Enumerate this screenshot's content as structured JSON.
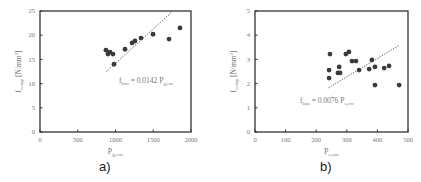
{
  "chart_data": [
    {
      "type": "scatter",
      "panel_label": "a)",
      "xlabel": "P_g,env",
      "ylabel": "f_comp [N/mm²]",
      "xlim": [
        0,
        2000
      ],
      "ylim": [
        0,
        25
      ],
      "xticks": [
        0,
        500,
        1000,
        1500,
        2000
      ],
      "yticks": [
        0,
        5,
        10,
        15,
        20,
        25
      ],
      "grid": false,
      "points": [
        {
          "x": 874,
          "y": 16.9
        },
        {
          "x": 927,
          "y": 16.5
        },
        {
          "x": 900,
          "y": 16.1
        },
        {
          "x": 967,
          "y": 16.1
        },
        {
          "x": 980,
          "y": 14.0
        },
        {
          "x": 1126,
          "y": 17.1
        },
        {
          "x": 1219,
          "y": 18.4
        },
        {
          "x": 1258,
          "y": 18.8
        },
        {
          "x": 1338,
          "y": 19.4
        },
        {
          "x": 1497,
          "y": 20.2
        },
        {
          "x": 1709,
          "y": 19.2
        },
        {
          "x": 1854,
          "y": 21.5
        }
      ],
      "trendline": {
        "slope": 0.0142,
        "x_start": 880,
        "x_end": 1760,
        "style": "dotted"
      },
      "annotation": "f_bias = 0.0142 P_g,env"
    },
    {
      "type": "scatter",
      "panel_label": "b)",
      "xlabel": "P_s,env",
      "ylabel": "f_comp [N/mm²]",
      "xlim": [
        0,
        500
      ],
      "ylim": [
        0,
        5
      ],
      "xticks": [
        0,
        100,
        200,
        300,
        400,
        500
      ],
      "yticks": [
        0,
        1,
        2,
        3,
        4,
        5
      ],
      "grid": false,
      "points": [
        {
          "x": 245,
          "y": 3.22
        },
        {
          "x": 242,
          "y": 2.56
        },
        {
          "x": 242,
          "y": 2.23
        },
        {
          "x": 271,
          "y": 2.44
        },
        {
          "x": 275,
          "y": 2.69
        },
        {
          "x": 278,
          "y": 2.44
        },
        {
          "x": 297,
          "y": 3.22
        },
        {
          "x": 307,
          "y": 3.31
        },
        {
          "x": 317,
          "y": 2.93
        },
        {
          "x": 330,
          "y": 2.93
        },
        {
          "x": 340,
          "y": 2.56
        },
        {
          "x": 373,
          "y": 2.6
        },
        {
          "x": 382,
          "y": 2.98
        },
        {
          "x": 392,
          "y": 2.69
        },
        {
          "x": 392,
          "y": 1.94
        },
        {
          "x": 422,
          "y": 2.64
        },
        {
          "x": 438,
          "y": 2.73
        },
        {
          "x": 471,
          "y": 1.94
        }
      ],
      "trendline": {
        "slope": 0.0076,
        "x_start": 240,
        "x_end": 470,
        "style": "dotted"
      },
      "annotation": "f_bias = 0.0076 P_s,env"
    }
  ],
  "panels": {
    "a": {
      "caption": "a)",
      "equation_main": "f",
      "equation_sub": "bias",
      "equation_rest": " = 0.0142 P",
      "equation_sub2": "g,env",
      "xlabel_main": "P",
      "xlabel_sub": "g,env",
      "ylabel_main": "f",
      "ylabel_sub": "comp",
      "ylabel_rest": " [N/mm",
      "ylabel_sup": "2",
      "ylabel_close": "]",
      "xticks": [
        "0",
        "500",
        "1000",
        "1500",
        "2000"
      ],
      "yticks": [
        "0",
        "5",
        "10",
        "15",
        "20",
        "25"
      ]
    },
    "b": {
      "caption": "b)",
      "equation_main": "f",
      "equation_sub": "bias",
      "equation_rest": " = 0.0076 P",
      "equation_sub2": "s,env",
      "xlabel_main": "P",
      "xlabel_sub": "s,env",
      "ylabel_main": "f",
      "ylabel_sub": "comp",
      "ylabel_rest": " [N/mm",
      "ylabel_sup": "2",
      "ylabel_close": "]",
      "xticks": [
        "0",
        "100",
        "200",
        "300",
        "400",
        "500"
      ],
      "yticks": [
        "0",
        "1",
        "2",
        "3",
        "4",
        "5"
      ]
    }
  },
  "colors": {
    "axis": "#333333",
    "point": "#3a3a3a",
    "text": "#777777",
    "trend": "#444444"
  }
}
